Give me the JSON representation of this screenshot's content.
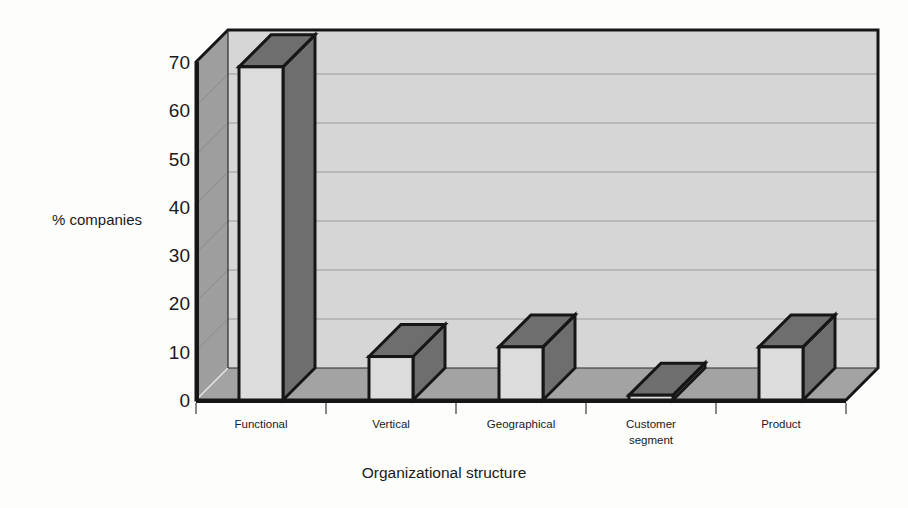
{
  "chart_data": {
    "type": "bar",
    "title": "",
    "subtitle": "",
    "xlabel": "Organizational structure",
    "ylabel": "% companies",
    "categories": [
      "Functional",
      "Vertical",
      "Geographical",
      "Customer segment",
      "Product"
    ],
    "category_lines": [
      [
        "Functional"
      ],
      [
        "Vertical"
      ],
      [
        "Geographical"
      ],
      [
        "Customer",
        "segment"
      ],
      [
        "Product"
      ]
    ],
    "values": [
      69,
      9,
      11,
      1,
      11
    ],
    "ylim": [
      0,
      70
    ],
    "yticks": [
      0,
      10,
      20,
      30,
      40,
      50,
      60,
      70
    ],
    "ytick_labels": [
      "0",
      "10",
      "20",
      "30",
      "40",
      "50",
      "60",
      "70"
    ],
    "grid": true,
    "grid_axis": "y",
    "legend": "none",
    "style": "3d-bar-grayscale",
    "colors": {
      "page_background": "#fdfdfc",
      "back_wall": "#d6d6d6",
      "side_wall": "#9e9e9e",
      "floor": "#a3a3a3",
      "bar_front": "#dcdcdc",
      "bar_top": "#6e6e6e",
      "bar_side": "#6e6e6e",
      "outline": "#161616",
      "gridline": "#9a9a9a",
      "text": "#1a1a1a"
    }
  },
  "axes": {
    "y_title": "% companies",
    "x_title": "Organizational structure"
  }
}
